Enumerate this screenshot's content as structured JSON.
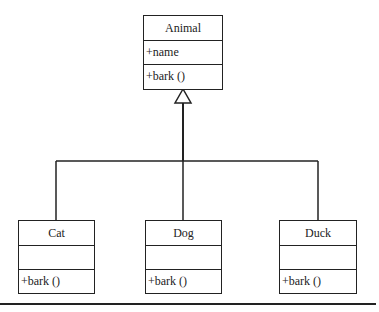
{
  "diagram": {
    "type": "uml-class-diagram",
    "parent": {
      "name": "Animal",
      "attributes": [
        "+name"
      ],
      "methods": [
        "+bark ()"
      ]
    },
    "children": [
      {
        "name": "Cat",
        "attributes": [],
        "methods": [
          "+bark ()"
        ]
      },
      {
        "name": "Dog",
        "attributes": [],
        "methods": [
          "+bark ()"
        ]
      },
      {
        "name": "Duck",
        "attributes": [],
        "methods": [
          "+bark ()"
        ]
      }
    ],
    "relationship": "generalization",
    "colors": {
      "line": "#222222",
      "background": "#ffffff"
    }
  }
}
